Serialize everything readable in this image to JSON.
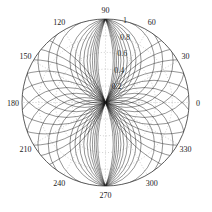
{
  "chart_data": {
    "type": "polar-line",
    "title": "",
    "theta_unit": "degrees",
    "angular_ticks": [
      0,
      30,
      60,
      90,
      120,
      150,
      180,
      210,
      240,
      270,
      300,
      330
    ],
    "angular_tick_labels": [
      "0",
      "30",
      "60",
      "90",
      "120",
      "150",
      "180",
      "210",
      "240",
      "270",
      "300",
      "330"
    ],
    "radial_ticks": [
      0.2,
      0.4,
      0.6,
      0.8,
      1
    ],
    "radial_tick_labels": [
      "0.2",
      "0.4",
      "0.6",
      "0.8",
      "1"
    ],
    "rlim": [
      0,
      1
    ],
    "grid": "dotted",
    "legend": null,
    "series_description": "Family of closed loops through the origin and the poles (90 and 270 deg, r=1), bulging left and right by varying amounts; outermost coincides with unit circle; symmetric about both axes.",
    "family_offsets": [
      0.08,
      0.16,
      0.25,
      0.35,
      0.46,
      0.58,
      0.72,
      0.88,
      1.06,
      1.3
    ],
    "line_color": "#1a1a1a",
    "grid_color": "#9a9a9a"
  },
  "layout": {
    "center": [
      105.5,
      102.5
    ],
    "radius": 83.5
  }
}
